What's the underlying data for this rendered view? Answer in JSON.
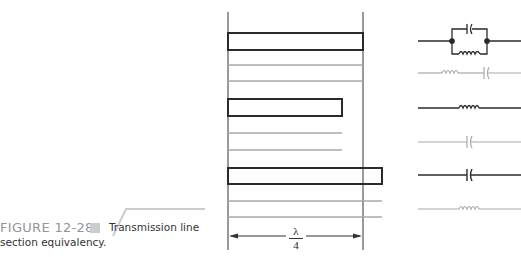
{
  "figure": {
    "number": "FIGURE 12-28",
    "caption_line1": "Transmission line",
    "caption_line2": "section equivalency."
  },
  "dimension": {
    "numerator": "λ",
    "denominator": "4"
  },
  "colors": {
    "dark_line": "#2a2a2a",
    "gray_line": "#a8a8a8",
    "caption_number": "#8f969c",
    "caption_square": "#c9cdd1"
  },
  "sections": [
    {
      "label": "open stub longer than quarter-wave",
      "equivalent": "parallel LC (tank)"
    },
    {
      "label": "shorted line",
      "equivalent": "series inductor-capacitor"
    },
    {
      "label": "open stub shorter than quarter-wave",
      "equivalent": "inductor"
    },
    {
      "label": "shorted line",
      "equivalent": "capacitor"
    },
    {
      "label": "open stub longer than quarter-wave",
      "equivalent": "capacitor"
    },
    {
      "label": "shorted line",
      "equivalent": "inductor"
    }
  ]
}
